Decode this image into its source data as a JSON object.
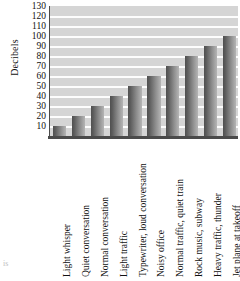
{
  "chart_data": {
    "type": "bar",
    "title": "",
    "xlabel": "",
    "ylabel": "Decibels",
    "ylim": [
      0,
      130
    ],
    "ytick_step": 10,
    "yticks": [
      10,
      20,
      30,
      40,
      50,
      60,
      70,
      80,
      90,
      100,
      110,
      120,
      130
    ],
    "grid": true,
    "legend": "none",
    "categories": [
      "Light whisper",
      "Quiet conversation",
      "Normal conversation",
      "Light traffic",
      "Typewriter, loud conversation",
      "Noisy office",
      "Normal traffic, quiet train",
      "Rock music, subway",
      "Heavy traffic, thunder",
      "Jet plane at takeoff"
    ],
    "values": [
      10,
      20,
      30,
      40,
      50,
      60,
      70,
      80,
      90,
      100
    ],
    "colors": {
      "plot_background": "#d5d5d5",
      "gridline": "#fdfdfd",
      "axis_line": "#4a4a4a",
      "bar_dark": "#4f4f4f",
      "bar_light": "#b4b4b4",
      "text": "#111111"
    }
  },
  "page_fragment": "is"
}
